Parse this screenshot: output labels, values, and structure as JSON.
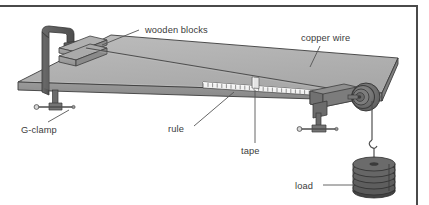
{
  "figure": {
    "background_color": "#ffffff",
    "frame_color": "#4a4a4a",
    "width": 429,
    "height": 205
  },
  "labels": {
    "wooden_blocks": "wooden blocks",
    "copper_wire": "copper wire",
    "g_clamp": "G-clamp",
    "rule": "rule",
    "tape": "tape",
    "load": "load"
  },
  "parts": {
    "bench_top": {
      "name": "bench top",
      "surface_color": "#b3b3b3",
      "edge_color": "#8c8c8c",
      "outline_color": "#3d3d3d"
    },
    "g_clamp_frame": {
      "name": "G-clamp frame",
      "color": "#5a5a5a"
    },
    "wooden_blocks_stack": {
      "name": "wooden blocks",
      "count": 2,
      "color": "#9e9e9e"
    },
    "copper_wire": {
      "name": "copper wire",
      "color": "#555555"
    },
    "rule": {
      "name": "rule",
      "tick_count": 26,
      "body_color": "#f2f2f2",
      "tick_color": "#7d7d7d"
    },
    "tape": {
      "name": "tape marker",
      "color": "#e8e8e8"
    },
    "pulley": {
      "name": "pulley wheel",
      "color": "#6e6e6e",
      "rings": 4
    },
    "load_stack": {
      "name": "slotted masses",
      "disc_count": 5,
      "color": "#5e5e5e"
    }
  },
  "colors": {
    "text": "#3b3b3b",
    "leader": "#555555",
    "light_gray": "#b3b3b3",
    "mid_gray": "#8c8c8c",
    "dark_gray": "#5a5a5a"
  }
}
